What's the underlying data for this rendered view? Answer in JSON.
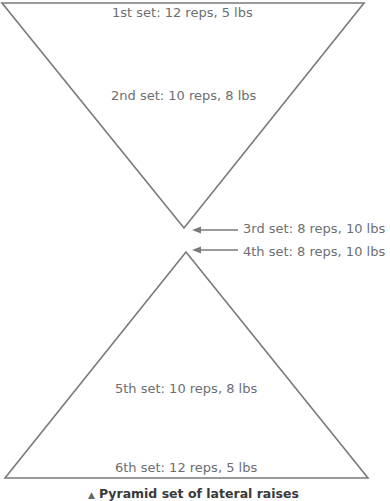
{
  "diagram": {
    "top_triangle_sets": [
      {
        "label": "1st set: 12 reps, 5 lbs"
      },
      {
        "label": "2nd set: 10 reps, 8 lbs"
      }
    ],
    "middle_sets": [
      {
        "label": "3rd set: 8 reps, 10 lbs"
      },
      {
        "label": "4th set: 8 reps, 10 lbs"
      }
    ],
    "bottom_triangle_sets": [
      {
        "label": "5th set: 10 reps, 8 lbs"
      },
      {
        "label": "6th set: 12 reps, 5 lbs"
      }
    ],
    "caption": {
      "marker": "▲",
      "text": "Pyramid set of lateral raises"
    },
    "colors": {
      "line": "#7a7a7a",
      "text": "#6d6e71"
    }
  }
}
